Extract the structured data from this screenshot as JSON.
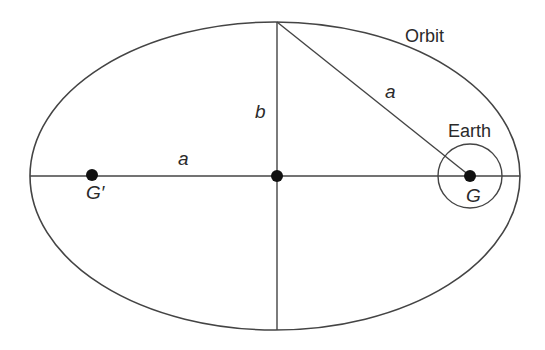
{
  "diagram": {
    "labels": {
      "orbit": "Orbit",
      "earth": "Earth",
      "semi_major_top": "a",
      "semi_major_left": "a",
      "semi_minor": "b",
      "focus_main": "G",
      "focus_empty": "G′"
    },
    "colors": {
      "stroke": "#444444",
      "dot": "#111111",
      "text": "#2a2a2a",
      "background": "#ffffff"
    }
  }
}
